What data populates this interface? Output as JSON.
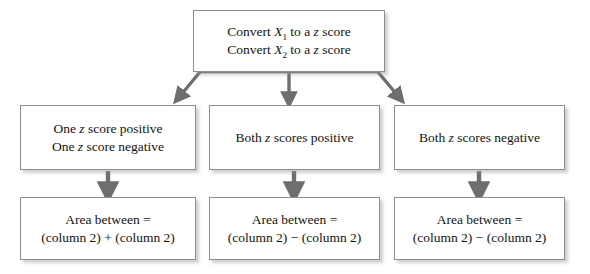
{
  "diagram": {
    "type": "flowchart",
    "top": {
      "id": "convert",
      "lines": [
        {
          "prefix": "Convert ",
          "variable": "X",
          "subscript": "1",
          "suffix": " to a ",
          "symbol": "z",
          "tail": " score"
        },
        {
          "prefix": "Convert ",
          "variable": "X",
          "subscript": "2",
          "suffix": " to a ",
          "symbol": "z",
          "tail": " score"
        }
      ]
    },
    "conditions": [
      {
        "id": "mixed-signs",
        "lines": [
          {
            "prefix": "One ",
            "symbol": "z",
            "tail": " score positive"
          },
          {
            "prefix": "One ",
            "symbol": "z",
            "tail": " score negative"
          }
        ]
      },
      {
        "id": "both-positive",
        "lines": [
          {
            "prefix": "Both ",
            "symbol": "z",
            "tail": " scores positive"
          }
        ]
      },
      {
        "id": "both-negative",
        "lines": [
          {
            "prefix": "Both ",
            "symbol": "z",
            "tail": " scores negative"
          }
        ]
      }
    ],
    "results": [
      {
        "id": "area-sum",
        "line1": "Area between =",
        "line2": "(column 2) + (column 2)",
        "operator": "+"
      },
      {
        "id": "area-difference-positive",
        "line1": "Area between =",
        "line2": "(column 2) − (column 2)",
        "operator": "−"
      },
      {
        "id": "area-difference-negative",
        "line1": "Area between =",
        "line2": "(column 2) − (column 2)",
        "operator": "−"
      }
    ],
    "colors": {
      "box_border": "#8d8d8d",
      "box_fill": "#ffffff",
      "arrow": "#6e6e6e",
      "text": "#141414",
      "shadow": "#c8c8c8"
    }
  }
}
